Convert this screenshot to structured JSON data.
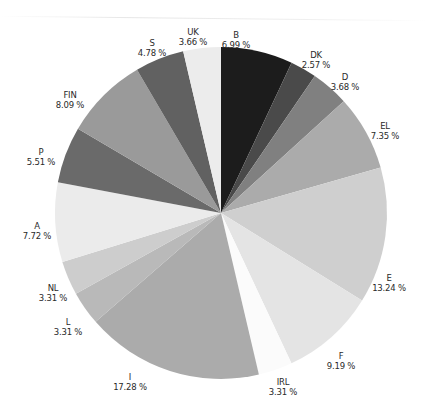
{
  "chart_data": {
    "type": "pie",
    "title": "",
    "start_angle_deg": 0,
    "direction": "clockwise",
    "slices": [
      {
        "label": "B",
        "value": 6.99,
        "display": "6.99 %",
        "color": "#1c1c1c"
      },
      {
        "label": "DK",
        "value": 2.57,
        "display": "2.57 %",
        "color": "#4a4a4a"
      },
      {
        "label": "D",
        "value": 3.68,
        "display": "3.68 %",
        "color": "#808080"
      },
      {
        "label": "EL",
        "value": 7.35,
        "display": "7.35 %",
        "color": "#ababab"
      },
      {
        "label": "E",
        "value": 13.24,
        "display": "13.24 %",
        "color": "#cfcfcf"
      },
      {
        "label": "F",
        "value": 9.19,
        "display": "9.19 %",
        "color": "#e4e4e4"
      },
      {
        "label": "IRL",
        "value": 3.31,
        "display": "3.31 %",
        "color": "#fbfbfb"
      },
      {
        "label": "I",
        "value": 17.28,
        "display": "17.28 %",
        "color": "#ababab"
      },
      {
        "label": "L",
        "value": 3.31,
        "display": "3.31 %",
        "color": "#b9b9b9"
      },
      {
        "label": "NL",
        "value": 3.31,
        "display": "3.31 %",
        "color": "#cdcdcd"
      },
      {
        "label": "A",
        "value": 7.72,
        "display": "7.72 %",
        "color": "#ebebeb"
      },
      {
        "label": "P",
        "value": 5.51,
        "display": "5.51 %",
        "color": "#6a6a6a"
      },
      {
        "label": "FIN",
        "value": 8.09,
        "display": "8.09 %",
        "color": "#9a9a9a"
      },
      {
        "label": "S",
        "value": 4.78,
        "display": "4.78 %",
        "color": "#616161"
      },
      {
        "label": "UK",
        "value": 3.66,
        "display": "3.66 %",
        "color": "#ececec"
      }
    ],
    "legend": "none (labels placed outside slices)"
  },
  "labels": {
    "B": {
      "name": "B",
      "pct": "6.99 %"
    },
    "DK": {
      "name": "DK",
      "pct": "2.57 %"
    },
    "D": {
      "name": "D",
      "pct": "3.68 %"
    },
    "EL": {
      "name": "EL",
      "pct": "7.35 %"
    },
    "E": {
      "name": "E",
      "pct": "13.24 %"
    },
    "F": {
      "name": "F",
      "pct": "9.19 %"
    },
    "IRL": {
      "name": "IRL",
      "pct": "3.31 %"
    },
    "I": {
      "name": "I",
      "pct": "17.28 %"
    },
    "L": {
      "name": "L",
      "pct": "3.31 %"
    },
    "NL": {
      "name": "NL",
      "pct": "3.31 %"
    },
    "A": {
      "name": "A",
      "pct": "7.72 %"
    },
    "P": {
      "name": "P",
      "pct": "5.51 %"
    },
    "FIN": {
      "name": "FIN",
      "pct": "8.09 %"
    },
    "S": {
      "name": "S",
      "pct": "4.78 %"
    },
    "UK": {
      "name": "UK",
      "pct": "3.66 %"
    }
  }
}
